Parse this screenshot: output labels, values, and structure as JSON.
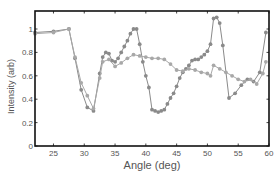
{
  "chart_data": {
    "type": "line",
    "title": "",
    "xlabel": "Angle (deg)",
    "ylabel": "Intensity (arb)",
    "xlim": [
      22,
      60
    ],
    "ylim": [
      0,
      1.15
    ],
    "xticks": [
      25,
      30,
      35,
      40,
      45,
      50,
      55,
      60
    ],
    "yticks": [
      0,
      0.2,
      0.4,
      0.6,
      0.8,
      1
    ],
    "ytick_labels": [
      "0",
      "0.2",
      "0.4",
      "0.6",
      "0.8",
      "1"
    ],
    "grid": false,
    "legend": null,
    "series": [
      {
        "name": "series-dark",
        "color": "#8a8a8a",
        "marker": "circle",
        "x": [
          22,
          25,
          27.5,
          28.5,
          29.5,
          30.5,
          31.5,
          32.5,
          33,
          33.5,
          34,
          34.5,
          35,
          35.5,
          36,
          36.5,
          37,
          37.5,
          38,
          38.5,
          39,
          39.5,
          40,
          40.5,
          41,
          41.5,
          42,
          42.5,
          43,
          43.5,
          44,
          44.5,
          45,
          45.5,
          46,
          46.5,
          47,
          47.5,
          48,
          48.5,
          49,
          49.5,
          50,
          50.5,
          51,
          51.5,
          52,
          52.5,
          53.5,
          54.5,
          55.5,
          56.5,
          57.5,
          58.5,
          59.5
        ],
        "y": [
          0.97,
          0.98,
          1.0,
          0.75,
          0.48,
          0.33,
          0.3,
          0.62,
          0.76,
          0.8,
          0.79,
          0.73,
          0.72,
          0.75,
          0.8,
          0.85,
          0.9,
          0.96,
          1.0,
          1.0,
          0.87,
          0.72,
          0.6,
          0.5,
          0.31,
          0.3,
          0.29,
          0.3,
          0.31,
          0.36,
          0.41,
          0.45,
          0.51,
          0.58,
          0.63,
          0.66,
          0.69,
          0.73,
          0.74,
          0.74,
          0.76,
          0.78,
          0.81,
          0.87,
          1.09,
          1.1,
          1.05,
          0.86,
          0.41,
          0.45,
          0.52,
          0.57,
          0.55,
          0.63,
          0.97
        ]
      },
      {
        "name": "series-light",
        "color": "#a8a8a8",
        "marker": "circle",
        "x": [
          22,
          25,
          27.5,
          28.5,
          29.5,
          30.5,
          31.5,
          32.5,
          33,
          34,
          35,
          36,
          37,
          38,
          39,
          40,
          41,
          42,
          43,
          44,
          45,
          46,
          47,
          48,
          49,
          50,
          50.5,
          51,
          52,
          53,
          54,
          55,
          56,
          57,
          58,
          59,
          59.5
        ],
        "y": [
          0.96,
          0.97,
          1.0,
          0.76,
          0.54,
          0.43,
          0.32,
          0.58,
          0.72,
          0.74,
          0.68,
          0.71,
          0.75,
          0.78,
          0.77,
          0.76,
          0.75,
          0.75,
          0.74,
          0.7,
          0.65,
          0.64,
          0.66,
          0.65,
          0.63,
          0.62,
          0.6,
          0.69,
          0.66,
          0.63,
          0.6,
          0.57,
          0.55,
          0.57,
          0.53,
          0.62,
          0.72
        ]
      }
    ]
  }
}
